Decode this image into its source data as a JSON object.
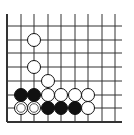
{
  "diagram": {
    "type": "go-board-fragment",
    "colors": {
      "background": "#ffffff",
      "line": "#333333",
      "black": "#111111",
      "white": "#ffffff"
    },
    "grid": {
      "cols_x": [
        7,
        21,
        34,
        48,
        61,
        75,
        88,
        102,
        115
      ],
      "rows_y": [
        26,
        40,
        53,
        67,
        81,
        95,
        108,
        122
      ],
      "top_open_y": 14,
      "right_open_x": 122,
      "edges": [
        "left",
        "bottom"
      ]
    },
    "stone_radius": 6.5,
    "stones": [
      {
        "color": "white",
        "col": 2,
        "row": 1
      },
      {
        "color": "white",
        "col": 2,
        "row": 3
      },
      {
        "color": "white",
        "col": 3,
        "row": 4
      },
      {
        "color": "black",
        "col": 1,
        "row": 5
      },
      {
        "color": "black",
        "col": 2,
        "row": 5
      },
      {
        "color": "white",
        "col": 3,
        "row": 5
      },
      {
        "color": "white",
        "col": 4,
        "row": 5
      },
      {
        "color": "white",
        "col": 5,
        "row": 5
      },
      {
        "color": "white",
        "col": 6,
        "row": 5
      },
      {
        "color": "white",
        "col": 1,
        "row": 6,
        "marker": "circle"
      },
      {
        "color": "white",
        "col": 2,
        "row": 6,
        "marker": "circle"
      },
      {
        "color": "black",
        "col": 3,
        "row": 6
      },
      {
        "color": "black",
        "col": 4,
        "row": 6
      },
      {
        "color": "black",
        "col": 5,
        "row": 6
      },
      {
        "color": "white",
        "col": 6,
        "row": 6
      }
    ]
  }
}
